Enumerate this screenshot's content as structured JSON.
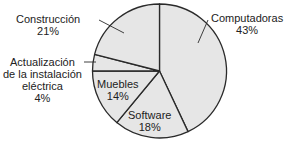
{
  "chart_data": {
    "type": "pie",
    "title": "",
    "categories": [
      "Computadoras",
      "Software",
      "Muebles",
      "Actualización de la instalación eléctrica",
      "Construcción"
    ],
    "values": [
      43,
      18,
      14,
      4,
      21
    ],
    "unit": "%",
    "start_angle_deg": 0,
    "direction": "clockwise",
    "fill_color": "#e6e6e6",
    "stroke_color": "#2a2a2a",
    "labels": [
      {
        "name": "Computadoras",
        "pct": "43%",
        "placement": "outside",
        "leader_line": true
      },
      {
        "name": "Software",
        "pct": "18%",
        "placement": "inside"
      },
      {
        "name": "Muebles",
        "pct": "14%",
        "placement": "inside"
      },
      {
        "name_lines": [
          "Actualización",
          "de la instalación",
          "eléctrica"
        ],
        "pct": "4%",
        "placement": "outside",
        "leader_line": true
      },
      {
        "name": "Construcción",
        "pct": "21%",
        "placement": "outside",
        "leader_line": true
      }
    ]
  }
}
